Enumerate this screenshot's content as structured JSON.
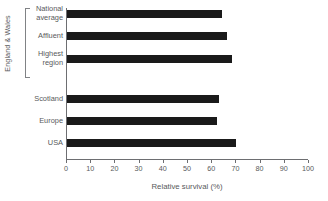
{
  "chart_data": {
    "type": "bar",
    "orientation": "horizontal",
    "title": "",
    "xlabel": "Relative survival (%)",
    "ylabel": "",
    "xlim": [
      0,
      100
    ],
    "xticks": [
      0,
      10,
      20,
      30,
      40,
      50,
      60,
      70,
      80,
      90,
      100
    ],
    "grid": false,
    "legend": null,
    "bar_color": "#1a1a1a",
    "axis_color": "#6d6e71",
    "text_color": "#58595b",
    "categories": [
      "National average",
      "Affluent",
      "Highest region",
      "Scotland",
      "Europe",
      "USA"
    ],
    "values": [
      64,
      66,
      68,
      63,
      62,
      70
    ],
    "groups": [
      {
        "label": "England & Wales",
        "categories": [
          "National average",
          "Affluent",
          "Highest region"
        ]
      }
    ]
  },
  "chart": {
    "axis_title": "Relative survival (%)",
    "group_label": "England & Wales",
    "categories": [
      {
        "label_line1": "National",
        "label_line2": "average",
        "value": 64
      },
      {
        "label_line1": "Affluent",
        "label_line2": "",
        "value": 66
      },
      {
        "label_line1": "Highest",
        "label_line2": "region",
        "value": 68
      },
      {
        "label_line1": "Scotland",
        "label_line2": "",
        "value": 63
      },
      {
        "label_line1": "Europe",
        "label_line2": "",
        "value": 62
      },
      {
        "label_line1": "USA",
        "label_line2": "",
        "value": 70
      }
    ],
    "tick_labels": [
      "0",
      "10",
      "20",
      "30",
      "40",
      "50",
      "60",
      "70",
      "80",
      "90",
      "100"
    ]
  }
}
